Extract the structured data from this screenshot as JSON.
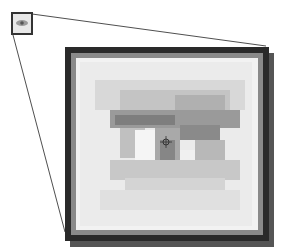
{
  "diagram": {
    "thumbnail": {
      "label": "eye-icon-thumbnail"
    },
    "magnified": {
      "label": "magnified-eye-view",
      "cursor": "crosshair"
    },
    "colors": {
      "frame_dark": "#2a2a2a",
      "frame_mid": "#6b6b6b",
      "shadow": "#555555",
      "connector": "#222222",
      "background": "#ffffff"
    }
  }
}
